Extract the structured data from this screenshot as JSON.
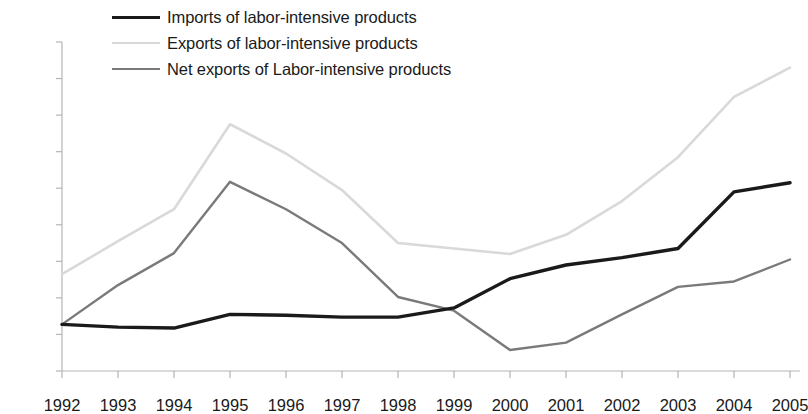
{
  "chart_data": {
    "type": "line",
    "title": "",
    "subtitle": "",
    "xlabel": "",
    "ylabel": "",
    "categories": [
      "1992",
      "1993",
      "1994",
      "1995",
      "1996",
      "1997",
      "1998",
      "1999",
      "2000",
      "2001",
      "2002",
      "2003",
      "2004",
      "2005"
    ],
    "ylim": [
      0,
      1800
    ],
    "ytick_values": [
      0,
      200,
      400,
      600,
      800,
      1000,
      1200,
      1400,
      1600,
      1800
    ],
    "ytick_labels": [
      "0",
      "200",
      "400",
      "600",
      "800",
      "1,000",
      "1,200",
      "1,400",
      "1,600",
      "1,800"
    ],
    "grid": false,
    "legend_position": "top",
    "series": [
      {
        "name": "Imports of labor-intensive products",
        "color": "#1a1a1a",
        "width": 3.4,
        "values": [
          255,
          240,
          235,
          310,
          305,
          295,
          295,
          345,
          505,
          580,
          620,
          670,
          980,
          1030
        ]
      },
      {
        "name": "Exports of labor-intensive products",
        "color": "#d9d9d9",
        "width": 2.6,
        "values": [
          530,
          710,
          885,
          1350,
          1190,
          990,
          700,
          670,
          640,
          745,
          930,
          1170,
          1500,
          1660
        ]
      },
      {
        "name": "Net exports of Labor-intensive products",
        "color": "#7a7a7a",
        "width": 2.4,
        "values": [
          255,
          470,
          645,
          1035,
          885,
          700,
          405,
          330,
          115,
          155,
          310,
          460,
          490,
          610
        ]
      }
    ]
  },
  "axis": {
    "line_color": "#b5b5b5",
    "tick_color": "#b5b5b5"
  }
}
